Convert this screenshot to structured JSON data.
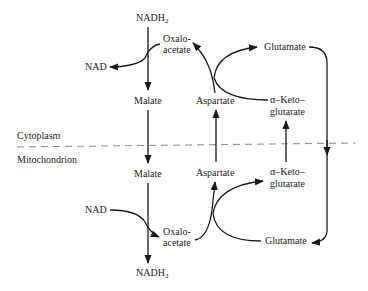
{
  "diagram": {
    "compartments": {
      "upper": "Cytoplasm",
      "lower": "Mitochondrion"
    },
    "cytoplasm": {
      "nadh2": "NADH",
      "nadh2_sub": "2",
      "nad": "NAD",
      "oxaloacetate_line1": "Oxalo-",
      "oxaloacetate_line2": "acetate",
      "malate": "Malate",
      "aspartate": "Aspartate",
      "glutamate": "Glutamate",
      "akg_line1": "α–Keto–",
      "akg_line2": "glutarate"
    },
    "mitochondrion": {
      "malate": "Malate",
      "nad": "NAD",
      "oxaloacetate_line1": "Oxalo-",
      "oxaloacetate_line2": "acetate",
      "nadh2": "NADH",
      "nadh2_sub": "2",
      "aspartate": "Aspartate",
      "glutamate": "Glutamate",
      "akg_line1": "α–Keto–",
      "akg_line2": "glutarate"
    },
    "colors": {
      "line": "#1a1a1a",
      "membrane_dash": "#8a8a8a",
      "background": "#ffffff"
    }
  }
}
